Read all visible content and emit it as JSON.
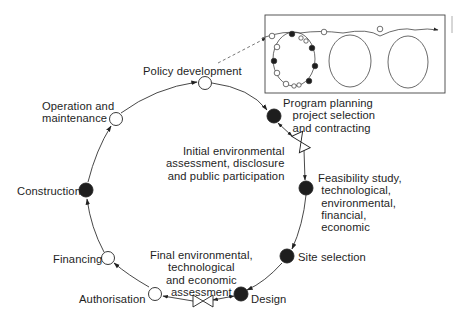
{
  "diagram": {
    "type": "project-cycle",
    "colors": {
      "line": "#333333",
      "filled_node": "#1e1e1e",
      "open_node": "#ffffff",
      "text": "#1e1e1e",
      "dashed": "#555555"
    },
    "nodes": [
      {
        "id": "policy",
        "label": "Policy development",
        "style": "open"
      },
      {
        "id": "program",
        "label": "Program planning\n   project selection\n   and contracting",
        "style": "filled"
      },
      {
        "id": "initial_ea",
        "label": "Initial environmental\nassessment, disclosure\nand public participation",
        "style": "bowtie"
      },
      {
        "id": "feasibility",
        "label": "Feasibility study,\n technological,\n environmental,\n financial,\n economic",
        "style": "filled"
      },
      {
        "id": "site",
        "label": "Site selection",
        "style": "filled"
      },
      {
        "id": "design",
        "label": "Design",
        "style": "filled"
      },
      {
        "id": "final_ea",
        "label": "Final environmental,\ntechnological\nand economic\nassessment",
        "style": "bowtie"
      },
      {
        "id": "authorisation",
        "label": "Authorisation",
        "style": "open"
      },
      {
        "id": "financing",
        "label": "Financing",
        "style": "open"
      },
      {
        "id": "construction",
        "label": "Construction",
        "style": "filled"
      },
      {
        "id": "operation",
        "label": "Operation and\nmaintenance",
        "style": "open"
      }
    ],
    "flow": [
      "policy",
      "program",
      "initial_ea",
      "feasibility",
      "site",
      "design",
      "final_ea",
      "authorisation",
      "financing",
      "construction",
      "operation",
      "policy"
    ],
    "inset": {
      "description": "Repeating cycle loops (spiral of successive project cycles)",
      "loops": 3
    }
  }
}
